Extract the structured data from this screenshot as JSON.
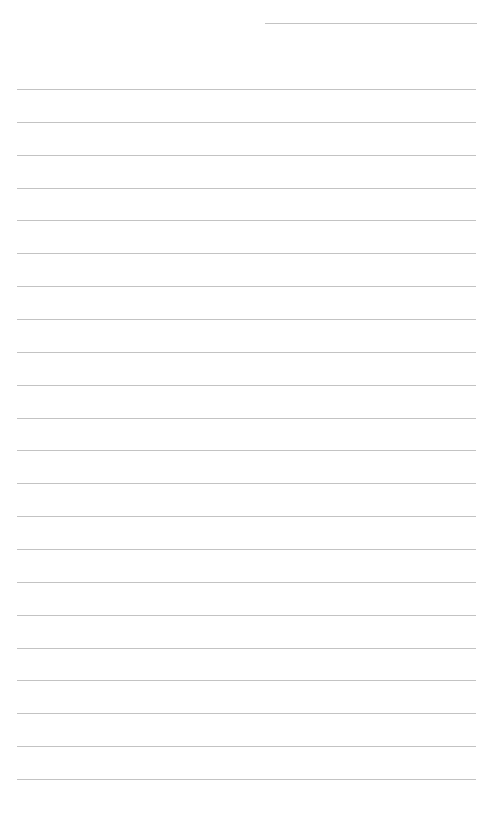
{
  "page": {
    "type": "lined-paper",
    "background": "#ffffff",
    "line_color": "#b8b8b8",
    "header_line": {
      "top": 23,
      "left": 265,
      "width": 212
    },
    "ruled_lines": {
      "count": 22,
      "first_top": 89,
      "spacing": 32.86,
      "left": 17,
      "width": 459
    }
  }
}
